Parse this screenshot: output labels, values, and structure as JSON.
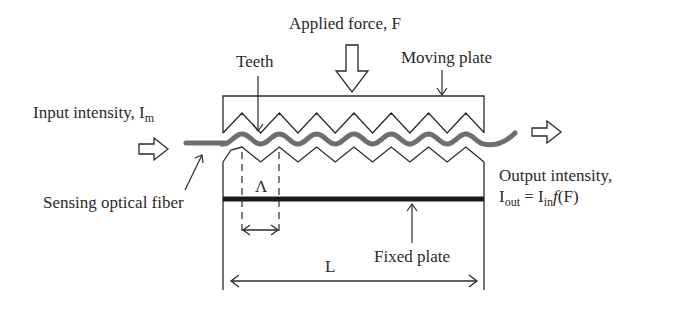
{
  "diagram": {
    "labels": {
      "applied_force": "Applied force, F",
      "teeth": "Teeth",
      "moving_plate": "Moving plate",
      "input_intensity_prefix": "Input intensity, I",
      "input_intensity_sub": "m",
      "output_intensity_line1": "Output intensity,",
      "output_I": "I",
      "output_sub_out": "out",
      "output_equals": " = I",
      "output_sub_in": "in",
      "output_f": "f",
      "output_arg": "(F)",
      "sensing_fiber": "Sensing optical fiber",
      "period": "Λ",
      "fixed_plate": "Fixed plate",
      "length": "L"
    },
    "teeth_count_upper": 7,
    "teeth_count_lower": 7,
    "colors": {
      "line": "#2a2a2a",
      "fiber": "#6e6e6e",
      "fixed_plate": "#1a1a1a"
    }
  }
}
